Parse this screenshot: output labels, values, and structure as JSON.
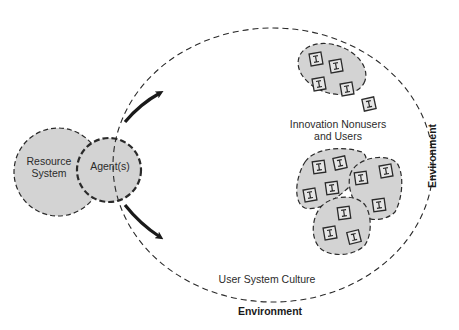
{
  "diagram": {
    "labels": {
      "resource_system_line1": "Resource",
      "resource_system_line2": "System",
      "agents": "Agent(s)",
      "innovation_line1": "Innovation Nonusers",
      "innovation_line2": "and Users",
      "user_system_culture": "User System Culture",
      "environment_bottom": "Environment",
      "environment_right": "Environment"
    },
    "icons": {
      "innovation_unit_glyph": "I"
    },
    "colors": {
      "fill_gray": "#d3d3d3",
      "stroke": "#2a2a2a",
      "arrow": "#1a1a1a",
      "background": "#ffffff"
    },
    "clusters": [
      {
        "name": "top-cluster",
        "unit_count": 4
      },
      {
        "name": "lower-left-cluster",
        "unit_count": 4
      },
      {
        "name": "lower-right-cluster",
        "unit_count": 3
      },
      {
        "name": "bottom-cluster",
        "unit_count": 3
      }
    ],
    "loose_units": 1
  }
}
